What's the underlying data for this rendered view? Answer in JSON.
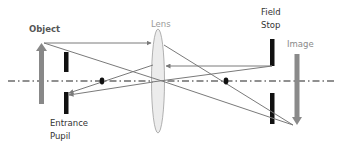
{
  "diagram": {
    "labels": {
      "object": "Object",
      "lens": "Lens",
      "field_stop_line1": "Field",
      "field_stop_line2": "Stop",
      "image": "Image",
      "entrance_pupil_line1": "Entrance",
      "entrance_pupil_line2": "Pupil"
    },
    "colors": {
      "ray": "#7a7a7a",
      "object_arrow": "#888888",
      "image_arrow": "#8a8a8a",
      "stop": "#111111",
      "lens_fill": "#ececec",
      "lens_stroke": "#a8a8a8",
      "axis": "#222222"
    },
    "elements": [
      {
        "name": "optical-axis",
        "type": "dash-dot line"
      },
      {
        "name": "object",
        "type": "upright arrow"
      },
      {
        "name": "entrance-pupil",
        "type": "aperture stop (two bars)"
      },
      {
        "name": "lens",
        "type": "converging lens"
      },
      {
        "name": "field-stop",
        "type": "aperture stop (two bars)"
      },
      {
        "name": "image",
        "type": "inverted arrow"
      },
      {
        "name": "focal-points",
        "type": "dots on axis",
        "count": 2
      }
    ]
  }
}
